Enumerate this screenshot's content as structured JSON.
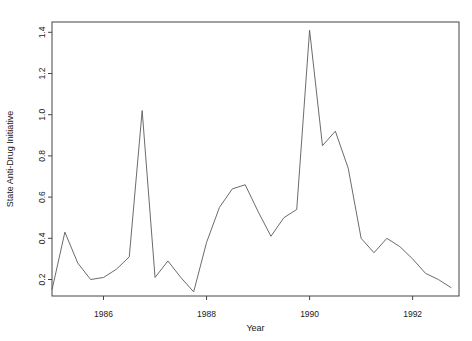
{
  "chart_data": {
    "type": "line",
    "title": "",
    "xlabel": "Year",
    "ylabel": "State Anti-Drug Initiative",
    "xlim": [
      1985.0,
      1992.9
    ],
    "ylim": [
      0.12,
      1.45
    ],
    "grid": false,
    "legend": null,
    "xticks": [
      1986,
      1988,
      1990,
      1992
    ],
    "xtick_labels": [
      "1986",
      "1988",
      "1990",
      "1992"
    ],
    "yticks": [
      0.2,
      0.4,
      0.6,
      0.8,
      1.0,
      1.2,
      1.4
    ],
    "ytick_labels": [
      "0.2",
      "0.4",
      "0.6",
      "0.8",
      "1.0",
      "1.2",
      "1.4"
    ],
    "line_color": "#5a5a5a",
    "axis_color": "#444444",
    "series": [
      {
        "name": "State Anti-Drug Initiative",
        "x": [
          1985.0,
          1985.25,
          1985.5,
          1985.75,
          1986.0,
          1986.25,
          1986.5,
          1986.75,
          1987.0,
          1987.25,
          1987.5,
          1987.75,
          1988.0,
          1988.25,
          1988.5,
          1988.75,
          1989.0,
          1989.25,
          1989.5,
          1989.75,
          1990.0,
          1990.25,
          1990.5,
          1990.75,
          1991.0,
          1991.25,
          1991.5,
          1991.75,
          1992.0,
          1992.25,
          1992.5,
          1992.75
        ],
        "values": [
          0.15,
          0.43,
          0.28,
          0.2,
          0.21,
          0.25,
          0.31,
          1.02,
          0.21,
          0.29,
          0.21,
          0.14,
          0.38,
          0.55,
          0.64,
          0.66,
          0.53,
          0.41,
          0.5,
          0.54,
          1.41,
          0.85,
          0.92,
          0.74,
          0.4,
          0.33,
          0.4,
          0.36,
          0.3,
          0.23,
          0.2,
          0.16
        ]
      }
    ]
  },
  "axes": {
    "x_title": "Year",
    "y_title": "State Anti-Drug Initiative"
  }
}
